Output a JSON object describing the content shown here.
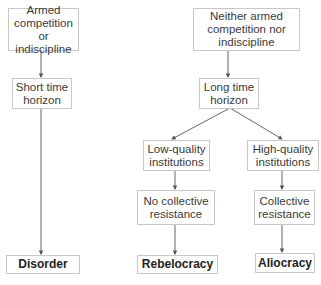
{
  "diagram": {
    "nodes": {
      "armed": "Armed competition or indiscipline",
      "short": "Short time horizon",
      "disorder": "Disorder",
      "neither": "Neither armed competition nor indiscipline",
      "long": "Long time horizon",
      "lowq": "Low-quality institutions",
      "highq": "High-quality institutions",
      "nocollective": "No collective resistance",
      "collective": "Collective resistance",
      "rebelocracy": "Rebelocracy",
      "aliocracy": "Aliocracy"
    },
    "edges": [
      [
        "armed",
        "short"
      ],
      [
        "short",
        "disorder"
      ],
      [
        "neither",
        "long"
      ],
      [
        "long",
        "lowq"
      ],
      [
        "long",
        "highq"
      ],
      [
        "lowq",
        "nocollective"
      ],
      [
        "nocollective",
        "rebelocracy"
      ],
      [
        "highq",
        "collective"
      ],
      [
        "collective",
        "aliocracy"
      ]
    ],
    "colors": {
      "line": "#555555",
      "border": "#c8c8c8",
      "text": "#3a3a3a"
    }
  }
}
